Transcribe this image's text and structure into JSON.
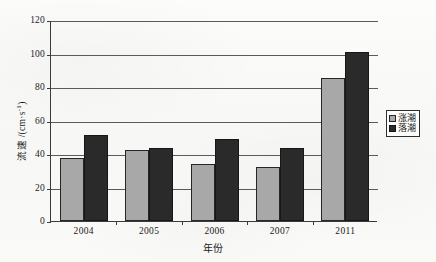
{
  "chart_data": {
    "type": "bar",
    "title": "",
    "subtitle": "",
    "xlabel": "年份",
    "ylabel": "流速 /(cm·s⁻¹)",
    "ylabel_main": "流速 /(cm·s",
    "ylabel_sup": "-1",
    "ylabel_tail": ")",
    "categories": [
      "2004",
      "2005",
      "2006",
      "2007",
      "2011"
    ],
    "series": [
      {
        "name": "涨潮",
        "color": "#a8a8a8",
        "values": [
          37.5,
          42.5,
          34,
          32,
          85.5
        ]
      },
      {
        "name": "落潮",
        "color": "#2a2a2a",
        "values": [
          51.5,
          43.5,
          49,
          43.5,
          101
        ]
      }
    ],
    "ylim": [
      0,
      120
    ],
    "ytick_values": [
      0,
      20,
      40,
      60,
      80,
      100,
      120
    ],
    "ytick_labels": [
      "0",
      "20",
      "40",
      "60",
      "80",
      "100",
      "120"
    ],
    "grid": "horizontal",
    "legend_position": "right-outside",
    "legend_entries": [
      "涨潮",
      "落潮"
    ]
  },
  "colors": {
    "flood_tide": "#a8a8a8",
    "ebb_tide": "#2a2a2a",
    "axis": "#3b3b3b",
    "gridline": "#5a5a5a",
    "background": "#fbfbfa"
  }
}
